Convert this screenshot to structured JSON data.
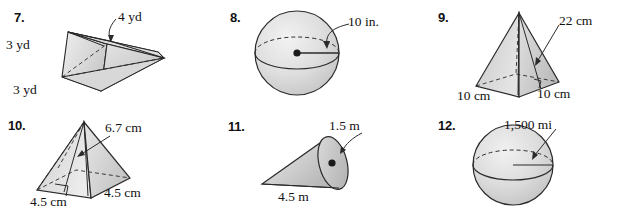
{
  "page": {
    "background_color": "#ffffff",
    "ink_color": "#111111",
    "fill_light": "#e8e8e8",
    "fill_mid": "#d2d2d2",
    "fill_dark": "#bdbdbd"
  },
  "problems": [
    {
      "number": "7.",
      "figure": "triangular-prism",
      "labels": [
        {
          "text": "4 yd",
          "role": "prism-edge-callout"
        },
        {
          "text": "3 yd",
          "role": "prism-height"
        },
        {
          "text": "3 yd",
          "role": "prism-base"
        }
      ]
    },
    {
      "number": "8.",
      "figure": "sphere",
      "labels": [
        {
          "text": "10 in.",
          "role": "sphere-radius-callout"
        }
      ]
    },
    {
      "number": "9.",
      "figure": "square-pyramid",
      "labels": [
        {
          "text": "22 cm",
          "role": "pyramid-slant-height-callout"
        },
        {
          "text": "10 cm",
          "role": "pyramid-base-edge-left"
        },
        {
          "text": "10 cm",
          "role": "pyramid-base-edge-right"
        }
      ]
    },
    {
      "number": "10.",
      "figure": "square-pyramid",
      "labels": [
        {
          "text": "6.7 cm",
          "role": "pyramid-height-callout"
        },
        {
          "text": "4.5 cm",
          "role": "pyramid-base-edge-right"
        },
        {
          "text": "4.5 cm",
          "role": "pyramid-base-edge-left"
        }
      ]
    },
    {
      "number": "11.",
      "figure": "cone",
      "labels": [
        {
          "text": "1.5 m",
          "role": "cone-radius-callout"
        },
        {
          "text": "4.5 m",
          "role": "cone-height"
        }
      ]
    },
    {
      "number": "12.",
      "figure": "sphere",
      "labels": [
        {
          "text": "1,500 mi",
          "role": "sphere-radius-callout"
        }
      ]
    }
  ]
}
